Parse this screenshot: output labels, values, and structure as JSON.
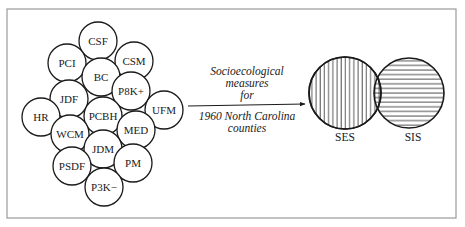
{
  "frame": {
    "x": 7,
    "y": 9,
    "width": 449,
    "height": 209,
    "stroke": "#9a9a9a"
  },
  "cluster": {
    "radius": 19,
    "circles": [
      {
        "label": "CSF",
        "cx": 98,
        "cy": 41
      },
      {
        "label": "PCI",
        "cx": 67,
        "cy": 63
      },
      {
        "label": "CSM",
        "cx": 134,
        "cy": 61
      },
      {
        "label": "BC",
        "cx": 101,
        "cy": 77
      },
      {
        "label": "P8K+",
        "cx": 131,
        "cy": 91
      },
      {
        "label": "JDF",
        "cx": 69,
        "cy": 99
      },
      {
        "label": "HR",
        "cx": 41,
        "cy": 117
      },
      {
        "label": "UFM",
        "cx": 164,
        "cy": 110
      },
      {
        "label": "PCBH",
        "cx": 103,
        "cy": 116
      },
      {
        "label": "WCM",
        "cx": 70,
        "cy": 134
      },
      {
        "label": "MED",
        "cx": 136,
        "cy": 130
      },
      {
        "label": "JDM",
        "cx": 103,
        "cy": 149
      },
      {
        "label": "PSDF",
        "cx": 72,
        "cy": 166
      },
      {
        "label": "PM",
        "cx": 133,
        "cy": 163
      },
      {
        "label": "P3K−",
        "cx": 104,
        "cy": 187
      }
    ]
  },
  "arrow": {
    "x1": 188,
    "y1": 106,
    "x2": 305,
    "y2": 104
  },
  "caption": {
    "above": [
      "Socioecological",
      "measures",
      "for"
    ],
    "below": [
      "1960 North Carolina",
      "counties"
    ]
  },
  "venn": {
    "ses": {
      "label": "SES",
      "cx": 345,
      "cy": 93,
      "r": 36,
      "hatch": "vertical"
    },
    "sis": {
      "label": "SIS",
      "cx": 409,
      "cy": 93,
      "r": 35,
      "hatch": "horizontal"
    }
  },
  "colors": {
    "ink": "#1a1a1a",
    "frame": "#9a9a9a",
    "background": "#ffffff"
  }
}
